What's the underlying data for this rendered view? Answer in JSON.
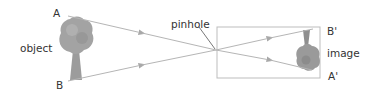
{
  "diagram": {
    "labels": {
      "object": "object",
      "point_a": "A",
      "point_b": "B",
      "pinhole": "pinhole",
      "image": "image",
      "point_a_image": "A'",
      "point_b_image": "B'"
    },
    "colors": {
      "ray": "#b5b5b5",
      "box": "#bdbdbd",
      "tree": "#9a9a9a",
      "text": "#333333"
    },
    "rays": [
      {
        "from": "A",
        "to": "A'",
        "through": "pinhole"
      },
      {
        "from": "B",
        "to": "B'",
        "through": "pinhole"
      }
    ],
    "image_orientation": "inverted"
  }
}
